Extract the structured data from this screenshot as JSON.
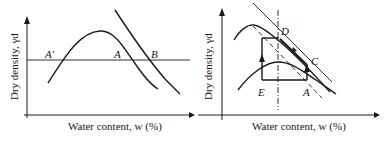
{
  "figures": [
    {
      "id": "left",
      "xlabel": "Water content, w (%)",
      "ylabel": "Dry density, γd",
      "point_labels": {
        "A_prime": "A′",
        "A": "A",
        "B": "B"
      },
      "elements": [
        "compaction curve",
        "horizontal density line",
        "line B"
      ]
    },
    {
      "id": "right",
      "xlabel": "Water content, w (%)",
      "ylabel": "Dry density, γd",
      "point_labels": {
        "C": "C",
        "D": "D",
        "E": "E",
        "A": "A"
      },
      "elements": [
        "upper compaction curve",
        "lower compaction curve",
        "zero air voids line",
        "line of optimums (dashed)",
        "vertical dash-dot line at constant w",
        "path A→C→D and E→D rectangle with arrows"
      ]
    }
  ],
  "colors": {
    "ink": "#1a1a1a",
    "background": "#ffffff"
  }
}
